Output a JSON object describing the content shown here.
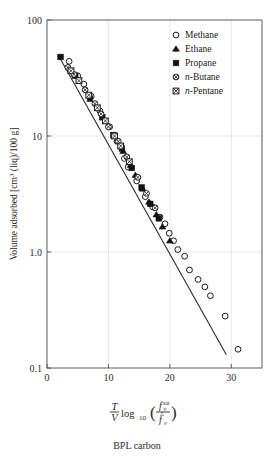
{
  "chart_data": {
    "type": "scatter",
    "title": "",
    "caption": "BPL carbon",
    "xlabel": "(T/V) log10( f_v^sat / f-hat_v )",
    "ylabel": "Volume adsorbed [cm3 (liq)/100 g]",
    "ylabel_parts": {
      "main": "Volume adsorbed [cm",
      "sup": "3",
      "tail": " (liq)/100 g]"
    },
    "xlabel_parts": {
      "num": "T",
      "den": "V",
      "log": "log",
      "logsub": "10",
      "fnum": "f",
      "fnum_sub": "v",
      "fnum_sup": "sat",
      "fden": "f",
      "fden_sub": "v"
    },
    "xscale": "linear",
    "yscale": "log",
    "xlim": [
      0,
      35
    ],
    "ylim": [
      0.1,
      100
    ],
    "xticks": [
      0,
      10,
      20,
      30
    ],
    "xticklabels": [
      "0",
      "10",
      "20",
      "30"
    ],
    "yticks": [
      0.1,
      1.0,
      10,
      100
    ],
    "yticklabels": [
      "0.1",
      "1.0",
      "10",
      "100"
    ],
    "grid": "major-both-light",
    "legend_position": "top-right-inside",
    "legend": [
      {
        "label": "Methane",
        "marker": "open-circle",
        "italic_prefix": ""
      },
      {
        "label": "Ethane",
        "marker": "solid-triangle",
        "italic_prefix": ""
      },
      {
        "label": "Propane",
        "marker": "solid-square",
        "italic_prefix": ""
      },
      {
        "label": "-Butane",
        "marker": "crossed-circle",
        "italic_prefix": "n"
      },
      {
        "label": "-Pentane",
        "marker": "crossed-square",
        "italic_prefix": "n"
      }
    ],
    "fit_line": {
      "x": [
        2.0,
        29.2
      ],
      "y": [
        48.0,
        0.13
      ],
      "style": "solid"
    },
    "series": [
      {
        "name": "Methane",
        "marker": "open-circle",
        "points": [
          [
            3.6,
            44.0
          ],
          [
            5.0,
            33.0
          ],
          [
            6.0,
            28.0
          ],
          [
            7.2,
            22.0
          ],
          [
            8.6,
            16.5
          ],
          [
            10.2,
            12.0
          ],
          [
            11.4,
            9.0
          ],
          [
            12.6,
            6.4
          ],
          [
            13.2,
            5.4
          ],
          [
            14.6,
            4.1
          ],
          [
            16.0,
            3.0
          ],
          [
            17.2,
            2.45
          ],
          [
            18.4,
            2.0
          ],
          [
            19.2,
            1.75
          ],
          [
            19.9,
            1.45
          ],
          [
            20.6,
            1.25
          ],
          [
            21.3,
            1.05
          ],
          [
            22.4,
            0.92
          ],
          [
            23.2,
            0.7
          ],
          [
            24.6,
            0.58
          ],
          [
            25.7,
            0.5
          ],
          [
            26.6,
            0.42
          ],
          [
            29.0,
            0.28
          ],
          [
            31.1,
            0.145
          ]
        ]
      },
      {
        "name": "Ethane",
        "marker": "solid-triangle",
        "points": [
          [
            11.0,
            10.0
          ],
          [
            12.4,
            7.4
          ],
          [
            13.6,
            5.6
          ],
          [
            14.4,
            4.6
          ],
          [
            15.6,
            3.5
          ],
          [
            16.6,
            2.7
          ],
          [
            17.8,
            2.1
          ],
          [
            18.8,
            1.65
          ],
          [
            20.0,
            1.25
          ]
        ]
      },
      {
        "name": "Propane",
        "marker": "solid-square",
        "points": [
          [
            2.2,
            48.0
          ],
          [
            4.6,
            33.0
          ],
          [
            7.0,
            21.0
          ],
          [
            9.0,
            14.5
          ],
          [
            10.8,
            10.2
          ],
          [
            12.2,
            7.8
          ],
          [
            13.8,
            5.3
          ],
          [
            15.4,
            3.6
          ],
          [
            16.8,
            2.6
          ],
          [
            18.2,
            1.95
          ]
        ]
      },
      {
        "name": "n-Butane",
        "marker": "crossed-circle",
        "points": [
          [
            3.4,
            39.0
          ],
          [
            4.4,
            34.0
          ],
          [
            6.2,
            25.0
          ],
          [
            7.8,
            19.0
          ],
          [
            8.8,
            15.5
          ],
          [
            10.0,
            12.0
          ],
          [
            11.6,
            9.0
          ],
          [
            13.0,
            6.6
          ],
          [
            14.8,
            4.4
          ],
          [
            16.2,
            3.2
          ],
          [
            17.6,
            2.4
          ]
        ]
      },
      {
        "name": "n-Pentane",
        "marker": "crossed-square",
        "points": [
          [
            3.9,
            36.5
          ],
          [
            5.2,
            30.0
          ],
          [
            6.8,
            22.5
          ],
          [
            8.2,
            17.5
          ],
          [
            9.5,
            13.5
          ],
          [
            11.0,
            10.0
          ],
          [
            12.0,
            8.2
          ],
          [
            13.4,
            6.0
          ]
        ]
      }
    ]
  }
}
